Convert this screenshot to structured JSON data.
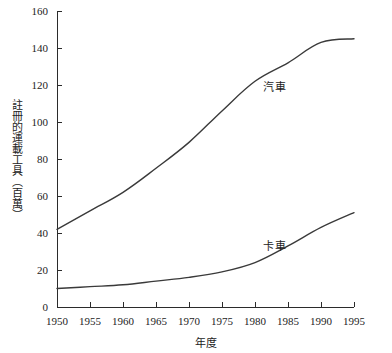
{
  "chart_data": {
    "type": "line",
    "title": "",
    "xlabel": "年度",
    "ylabel": "註冊的運載工具（百萬）",
    "xlim": [
      1950,
      1995
    ],
    "ylim": [
      0,
      160
    ],
    "grid": false,
    "legend_position": "inline-annotation",
    "x": [
      1950,
      1955,
      1960,
      1965,
      1970,
      1975,
      1980,
      1985,
      1990,
      1995
    ],
    "xticks": [
      "1950",
      "1955",
      "1960",
      "1965",
      "1970",
      "1975",
      "1980",
      "1985",
      "1990",
      "1995"
    ],
    "yticks": [
      "0",
      "20",
      "40",
      "60",
      "80",
      "100",
      "120",
      "140",
      "160"
    ],
    "ytick_values": [
      0,
      20,
      40,
      60,
      80,
      100,
      120,
      140,
      160
    ],
    "series": [
      {
        "name": "汽車",
        "color": "#3a3a3a",
        "label_x": 1995,
        "values": [
          42,
          52,
          62,
          75,
          89,
          106,
          122,
          132,
          143,
          145
        ]
      },
      {
        "name": "卡車",
        "color": "#3a3a3a",
        "label_x": 1995,
        "values": [
          10,
          11,
          12,
          14,
          16,
          19,
          24,
          33,
          43,
          51
        ]
      }
    ],
    "annotations": [
      {
        "text": "汽車",
        "x": 1983,
        "y": 117
      },
      {
        "text": "卡車",
        "x": 1983,
        "y": 31
      }
    ]
  }
}
